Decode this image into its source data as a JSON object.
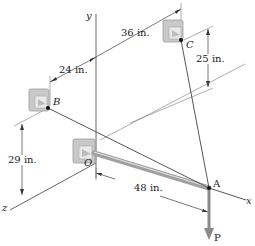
{
  "figure": {
    "points": {
      "O": "O",
      "A": "A",
      "B": "B",
      "C": "C"
    },
    "axes": {
      "x": "x",
      "y": "y",
      "z": "z"
    },
    "load": "P",
    "dimensions": {
      "d_36": "36 in.",
      "d_24": "24 in.",
      "d_25": "25 in.",
      "d_29": "29 in.",
      "d_48": "48 in."
    },
    "colors": {
      "line": "#555555",
      "rod": "#9a9a9a",
      "bracket": "#c8c8c8",
      "cable": "#666666"
    }
  }
}
